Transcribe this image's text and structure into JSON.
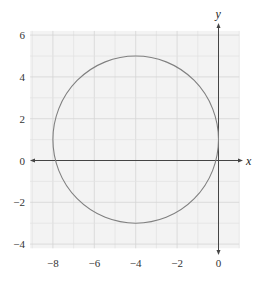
{
  "chart_data": {
    "type": "line",
    "title": "",
    "xlabel": "x",
    "ylabel": "y",
    "xlim": [
      -9.1,
      1.0
    ],
    "ylim": [
      -4.2,
      6.2
    ],
    "grid": true,
    "grid_minor_step": 1,
    "grid_major_step": 2,
    "x_ticks": [
      -8,
      -6,
      -4,
      -2,
      0
    ],
    "x_tick_labels": [
      "−8",
      "−6",
      "−4",
      "−2",
      "0"
    ],
    "y_ticks": [
      6,
      4,
      2,
      0,
      -2,
      -4
    ],
    "y_tick_labels": [
      "6",
      "4",
      "2",
      "0",
      "−2",
      "−4"
    ],
    "series": [
      {
        "name": "circle",
        "shape": "circle",
        "center": [
          -4,
          1
        ],
        "radius": 4,
        "equation": "(x + 4)^2 + (y - 1)^2 = 16",
        "color": "#808080"
      }
    ],
    "legend": null
  },
  "colors": {
    "grid_bg": "#f3f3f3",
    "grid_minor": "#e2e2e2",
    "grid_major": "#d4d4d4",
    "axis": "#444444",
    "curve": "#808080"
  }
}
